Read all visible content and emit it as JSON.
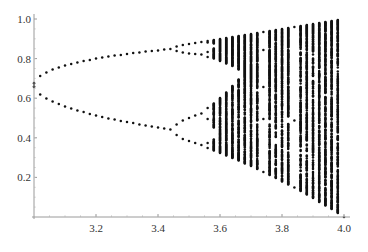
{
  "chart_data": {
    "type": "scatter",
    "title": "",
    "xlabel": "",
    "ylabel": "",
    "xlim": [
      3.0,
      4.0
    ],
    "ylim": [
      0.0,
      1.0
    ],
    "grid": false,
    "legend": null,
    "x_ticks": [
      3.2,
      3.4,
      3.6,
      3.8,
      4.0
    ],
    "x_tick_labels": [
      "3.2",
      "3.4",
      "3.6",
      "3.8",
      "4.0"
    ],
    "y_ticks": [
      0.2,
      0.4,
      0.6,
      0.8,
      1.0
    ],
    "y_tick_labels": [
      "0.2",
      "0.4",
      "0.6",
      "0.8",
      "1.0"
    ],
    "r_start": 3.0,
    "r_end": 4.0,
    "r_step": 0.02,
    "x0": 0.5,
    "transient_iterations": 500,
    "plotted_iterations": 400,
    "sample_points": [
      {
        "r": 3.0,
        "x": [
          0.667
        ]
      },
      {
        "r": 3.1,
        "x": [
          0.558,
          0.765
        ]
      },
      {
        "r": 3.2,
        "x": [
          0.513,
          0.799
        ]
      },
      {
        "r": 3.4,
        "x": [
          0.452,
          0.842
        ]
      },
      {
        "r": 3.5,
        "x": [
          0.383,
          0.501,
          0.827,
          0.875
        ]
      },
      {
        "r": 3.6,
        "x_range": [
          0.32,
          0.9
        ]
      },
      {
        "r": 3.74,
        "x": [
          0.23,
          0.66,
          0.84,
          0.93
        ]
      },
      {
        "r": 3.84,
        "x": [
          0.149,
          0.488,
          0.959
        ]
      },
      {
        "r": 4.0,
        "x_range": [
          0.0,
          1.0
        ]
      }
    ],
    "point_color": "#111111"
  }
}
